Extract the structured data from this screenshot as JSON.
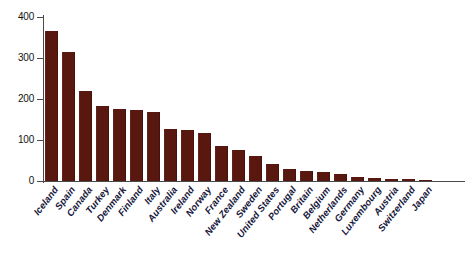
{
  "chart_data": {
    "type": "bar",
    "title": "",
    "subtitle": "",
    "xlabel": "",
    "ylabel": "",
    "ylim": [
      0,
      400
    ],
    "yticks": [
      0,
      100,
      200,
      300,
      400
    ],
    "ytick_labels": [
      "0",
      "100",
      "200",
      "300",
      "400"
    ],
    "grid": false,
    "legend": false,
    "bar_color": "#58170f",
    "axis_color": "#4a4a4a",
    "label_color": "#15163a",
    "categories": [
      "Iceland",
      "Spain",
      "Canada",
      "Turkey",
      "Denmark",
      "Finland",
      "Italy",
      "Australia",
      "Ireland",
      "Norway",
      "France",
      "New Zealand",
      "Sweden",
      "United States",
      "Portugal",
      "Britain",
      "Belgium",
      "Netherlands",
      "Germany",
      "Luxembourg",
      "Austria",
      "Switzerland",
      "Japan"
    ],
    "values": [
      367,
      315,
      220,
      183,
      176,
      174,
      168,
      127,
      124,
      117,
      85,
      76,
      61,
      41,
      29,
      24,
      23,
      17,
      10,
      7,
      5,
      4,
      3
    ]
  },
  "caption": {
    "ghost_text": ""
  }
}
